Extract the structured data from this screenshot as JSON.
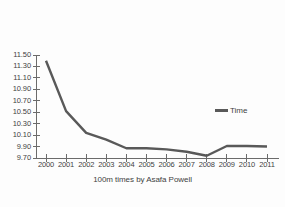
{
  "chart_data": {
    "type": "line",
    "title": "100m times by Asafa Powell",
    "xlabel": "",
    "ylabel": "",
    "grid": false,
    "legend_position": "right",
    "line_color": "#595959",
    "categories": [
      "2000",
      "2001",
      "2002",
      "2003",
      "2004",
      "2005",
      "2006",
      "2007",
      "2008",
      "2009",
      "2010",
      "2011"
    ],
    "x": [
      2000,
      2001,
      2002,
      2003,
      2004,
      2005,
      2006,
      2007,
      2008,
      2009,
      2010,
      2011
    ],
    "series": [
      {
        "name": "Time",
        "values": [
          11.4,
          10.52,
          10.14,
          10.02,
          9.87,
          9.87,
          9.85,
          9.81,
          9.74,
          9.91,
          9.91,
          9.9
        ]
      }
    ],
    "ylim": [
      9.7,
      11.5
    ],
    "xlim": [
      2000,
      2011
    ],
    "y_ticks": [
      11.5,
      11.3,
      11.1,
      10.9,
      10.7,
      10.5,
      10.3,
      10.1,
      9.9,
      9.7
    ],
    "y_tick_labels": [
      "11.50",
      "11.30",
      "11.10",
      "10.90",
      "10.70",
      "10.50",
      "10.30",
      "10.10",
      "9.90",
      "9.70"
    ],
    "x_tick_labels": [
      "2000",
      "2001",
      "2002",
      "2003",
      "2004",
      "2005",
      "2006",
      "2007",
      "2008",
      "2009",
      "2010",
      "2011"
    ]
  },
  "legend": {
    "entries": [
      {
        "label": "Time",
        "color": "#595959"
      }
    ]
  },
  "axis": {
    "color": "#6b6b6b"
  }
}
